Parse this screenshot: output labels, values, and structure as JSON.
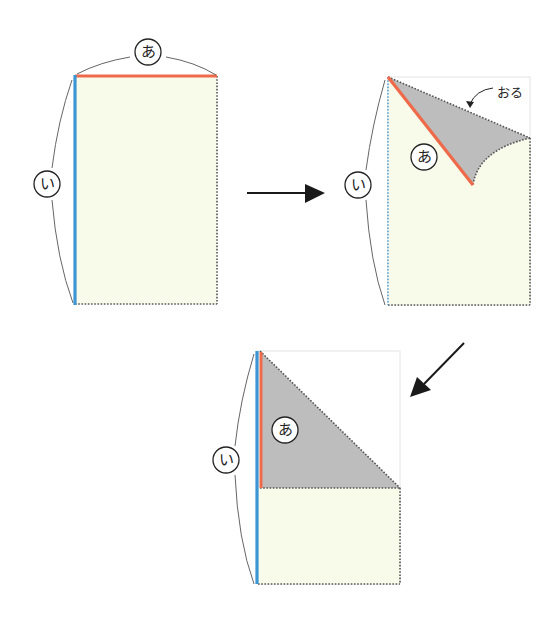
{
  "diagram": {
    "colors": {
      "paper": "#f8fbe9",
      "folded": "#bdbdbd",
      "edge_a": "#ee6a4a",
      "edge_i": "#3d95d4",
      "dotted": "#555555",
      "arc": "#666666",
      "arrow": "#1a1a1a"
    },
    "step1": {
      "label_a": "あ",
      "label_i": "い"
    },
    "step2": {
      "label_a": "あ",
      "label_i": "い",
      "fold_label": "おる"
    },
    "step3": {
      "label_a": "あ",
      "label_i": "い"
    }
  }
}
